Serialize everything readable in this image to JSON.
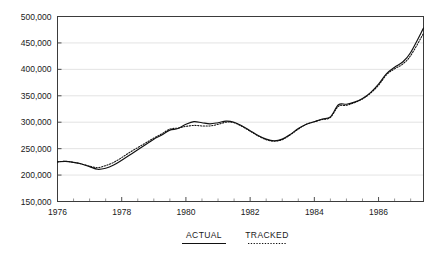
{
  "chart_data": {
    "type": "line",
    "title": "",
    "subtitle": "",
    "xlabel": "",
    "ylabel": "",
    "xlim": [
      1976.0,
      1987.4
    ],
    "ylim": [
      150000,
      500000
    ],
    "grid": true,
    "grid_axis": "y",
    "legend_position": "below-axes",
    "y_ticks": [
      150000,
      200000,
      250000,
      300000,
      350000,
      400000,
      450000,
      500000
    ],
    "y_tick_labels": [
      "150,000",
      "200,000",
      "250,000",
      "300,000",
      "350,000",
      "400,000",
      "450,000",
      "500,000"
    ],
    "y_minor_tick_step": 10000,
    "x_ticks": [
      1976,
      1978,
      1980,
      1982,
      1984,
      1986
    ],
    "x_tick_labels": [
      "1976",
      "1978",
      "1980",
      "1982",
      "1984",
      "1986"
    ],
    "x_minor_tick_step": 0.5,
    "x": [
      1976.0,
      1976.25,
      1976.5,
      1976.75,
      1977.0,
      1977.25,
      1977.5,
      1977.75,
      1978.0,
      1978.25,
      1978.5,
      1978.75,
      1979.0,
      1979.25,
      1979.5,
      1979.75,
      1980.0,
      1980.25,
      1980.5,
      1980.75,
      1981.0,
      1981.25,
      1981.5,
      1981.75,
      1982.0,
      1982.25,
      1982.5,
      1982.75,
      1983.0,
      1983.25,
      1983.5,
      1983.75,
      1984.0,
      1984.25,
      1984.5,
      1984.75,
      1985.0,
      1985.25,
      1985.5,
      1985.75,
      1986.0,
      1986.25,
      1986.5,
      1986.75,
      1987.0,
      1987.4
    ],
    "series": [
      {
        "name": "ACTUAL",
        "style": "solid",
        "color": "#111111",
        "values": [
          225000,
          226000,
          224000,
          221000,
          216000,
          211000,
          213000,
          219000,
          228000,
          238000,
          248000,
          258000,
          268000,
          276000,
          285000,
          288000,
          296000,
          301000,
          299000,
          297000,
          299000,
          302000,
          300000,
          293000,
          284000,
          275000,
          268000,
          265000,
          268000,
          277000,
          288000,
          296000,
          301000,
          306000,
          310000,
          333000,
          334000,
          338000,
          345000,
          356000,
          372000,
          392000,
          404000,
          414000,
          432000,
          478000
        ]
      },
      {
        "name": "TRACKED",
        "style": "dotted",
        "color": "#111111",
        "values": [
          225000,
          226000,
          224000,
          221000,
          217000,
          214000,
          218000,
          224000,
          233000,
          243000,
          252000,
          261000,
          270000,
          278000,
          287000,
          289000,
          292000,
          294000,
          293000,
          293000,
          296000,
          300000,
          299000,
          292000,
          283000,
          274000,
          267000,
          264000,
          267000,
          276000,
          287000,
          296000,
          301000,
          305000,
          309000,
          330000,
          332000,
          337000,
          344000,
          355000,
          370000,
          390000,
          401000,
          410000,
          426000,
          468000
        ]
      }
    ],
    "legend": [
      {
        "label": "ACTUAL",
        "style": "solid"
      },
      {
        "label": "TRACKED",
        "style": "dotted"
      }
    ],
    "colors": {
      "line": "#111111",
      "frame": "#3b3b3b",
      "grid": "#dcdcdc",
      "background": "#ffffff",
      "text": "#1a1a1a"
    }
  }
}
